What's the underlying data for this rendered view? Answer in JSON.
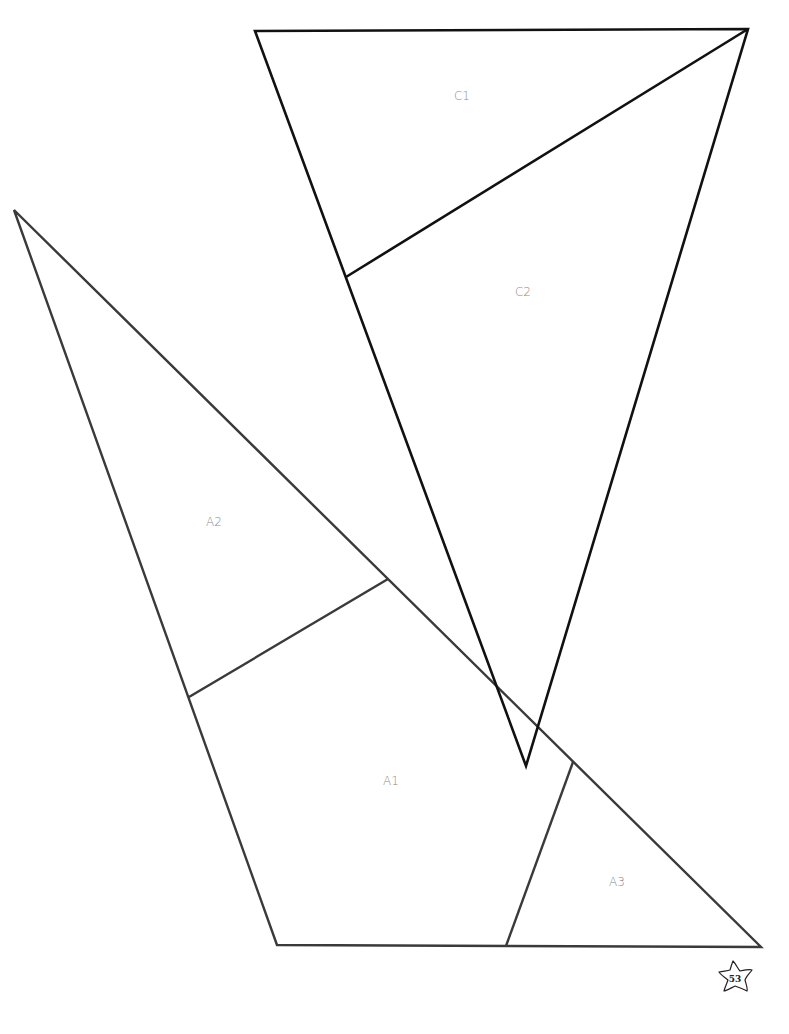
{
  "pattern": {
    "pieces": [
      {
        "id": "C",
        "label_color": "#8a8a8a",
        "stroke": "#111111",
        "sections": [
          {
            "label": "C1",
            "x": 462,
            "y": 100
          },
          {
            "label": "C2",
            "x": 523,
            "y": 296
          }
        ]
      },
      {
        "id": "A",
        "label_color": "#8a8a8a",
        "stroke": "#3a3a3a",
        "sections": [
          {
            "label": "A2",
            "x": 214,
            "y": 526
          },
          {
            "label": "A1",
            "x": 391,
            "y": 785
          },
          {
            "label": "A3",
            "x": 617,
            "y": 886
          }
        ]
      }
    ]
  },
  "footer": {
    "page_number": "53",
    "badge_icon": "star-icon"
  }
}
